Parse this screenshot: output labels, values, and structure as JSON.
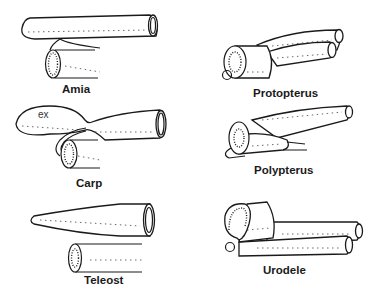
{
  "figure": {
    "panels": [
      {
        "id": "amia",
        "label": "Amia"
      },
      {
        "id": "protopterus",
        "label": "Protopterus"
      },
      {
        "id": "carp",
        "label": "Carp",
        "annotation": "ex"
      },
      {
        "id": "polypterus",
        "label": "Polypterus"
      },
      {
        "id": "teleost",
        "label": "Teleost"
      },
      {
        "id": "urodele",
        "label": "Urodele"
      }
    ]
  },
  "colors": {
    "line": "#1a1a1a",
    "background": "#ffffff"
  }
}
